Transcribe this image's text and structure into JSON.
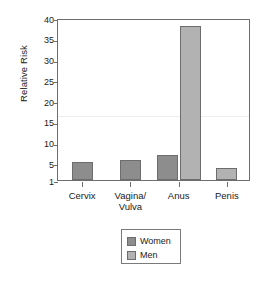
{
  "chart_data": {
    "type": "bar",
    "title": "",
    "subtitle": "",
    "xlabel": "",
    "ylabel": "Relative Risk",
    "categories": [
      "Cervix",
      "Vagina/ Vulva",
      "Anus",
      "Penis"
    ],
    "category_lines": [
      [
        "Cervix"
      ],
      [
        "Vagina/",
        "Vulva"
      ],
      [
        "Anus"
      ],
      [
        "Penis"
      ]
    ],
    "series": [
      {
        "name": "Women",
        "color": "#8d8d8d",
        "values": [
          5.3,
          5.8,
          7.0,
          null
        ]
      },
      {
        "name": "Men",
        "color": "#b2b2b2",
        "values": [
          null,
          null,
          38.0,
          4.0
        ]
      }
    ],
    "ylim": [
      1,
      40
    ],
    "yticks": [
      1,
      5,
      10,
      15,
      20,
      25,
      30,
      35,
      40
    ],
    "ytick_labels": [
      "1",
      "5",
      "10",
      "15",
      "20",
      "25",
      "30",
      "35",
      "40"
    ],
    "grid": false,
    "faint_gridline_value": 17,
    "legend_position": "bottom-center",
    "legend_entries": [
      "Women",
      "Men"
    ]
  },
  "axis": {
    "y_title": "Relative Risk"
  },
  "legend": {
    "women_label": "Women",
    "men_label": "Men"
  }
}
